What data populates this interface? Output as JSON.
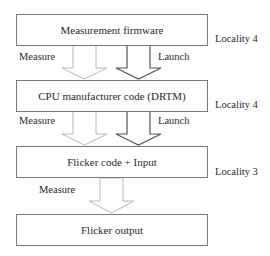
{
  "boxes": [
    {
      "label": "Measurement firmware",
      "locality": "Locality 4"
    },
    {
      "label": "CPU manufacturer code (DRTM)",
      "locality": "Locality 4"
    },
    {
      "label": "Flicker code + Input",
      "locality": "Locality 3"
    },
    {
      "label": "Flicker output"
    }
  ],
  "arrows": [
    {
      "from": 0,
      "to": 1,
      "measure_label": "Measure",
      "launch_label": "Launch"
    },
    {
      "from": 1,
      "to": 2,
      "measure_label": "Measure",
      "launch_label": "Launch"
    },
    {
      "from": 2,
      "to": 3,
      "measure_label": "Measure"
    }
  ],
  "colors": {
    "measure_arrow": "#b8b8b8",
    "launch_arrow": "#555555",
    "box_border": "#7a7a7a"
  }
}
